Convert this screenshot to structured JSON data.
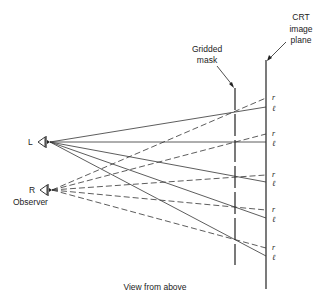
{
  "labels": {
    "crt_line1": "CRT",
    "crt_line2": "image",
    "crt_line3": "plane",
    "mask_line1": "Gridded",
    "mask_line2": "mask",
    "left_eye": "L",
    "right_eye": "R",
    "observer": "Observer",
    "caption": "View from above",
    "r": "r",
    "l": "ℓ"
  },
  "geometry": {
    "left_eye": {
      "x": 50,
      "y": 142
    },
    "right_eye": {
      "x": 52,
      "y": 190
    },
    "mask_x": 235,
    "crt_x": 266,
    "image_points": [
      {
        "r": 98,
        "l": 107
      },
      {
        "r": 134,
        "l": 142
      },
      {
        "r": 175,
        "l": 182
      },
      {
        "r": 210,
        "l": 218
      },
      {
        "r": 248,
        "l": 256
      }
    ]
  },
  "legend": {
    "solid": "Left eye rays",
    "dashed": "Right eye rays"
  }
}
